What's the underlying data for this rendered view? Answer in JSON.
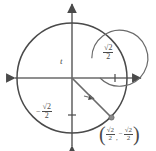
{
  "figure": {
    "kind": "unit-circle-diagram",
    "title": "",
    "colors": {
      "stroke": "#4a4a4a",
      "axis": "#5a5a5a",
      "background": "#ffffff",
      "text": "#4a4a4a"
    },
    "geometry": {
      "center_x": 72,
      "center_y": 78,
      "outer_radius": 55,
      "inner_arc_radius": 28,
      "terminal_point_x": 111,
      "terminal_point_y": 117,
      "terminal_angle_degrees": -45
    }
  },
  "axes": {
    "x_axis_name": "horizontal-axis",
    "y_axis_name": "vertical-axis",
    "x_tick_value": "sqrt2-over-2",
    "y_tick_value": "negative-sqrt2-over-2"
  },
  "labels": {
    "angle": "t",
    "x_tick": {
      "numerator": "√2",
      "denominator": "2"
    },
    "y_tick": {
      "sign": "−",
      "numerator": "√2",
      "denominator": "2"
    },
    "point": {
      "open_paren": "(",
      "close_paren": ")",
      "comma": ",",
      "x": {
        "numerator": "√2",
        "denominator": "2"
      },
      "y": {
        "sign": "−",
        "numerator": "√2",
        "denominator": "2"
      }
    }
  },
  "icons": {
    "axis_arrow": "arrowhead-icon",
    "rotation_arrow": "clockwise-arc-arrow-icon",
    "terminal_dot": "point-marker-icon"
  }
}
